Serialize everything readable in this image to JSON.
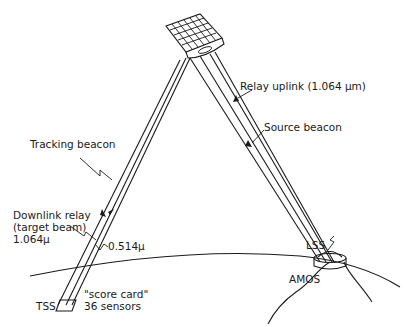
{
  "diagram": {
    "labels": {
      "relay_uplink": "Relay uplink (1.064 μm)",
      "source_beacon": "Source beacon",
      "tracking_beacon": "Tracking beacon",
      "downlink_line1": "Downlink relay",
      "downlink_line2": "(target beam)",
      "downlink_line3": "1.064μ",
      "green_wavelength": "0.514μ",
      "lss": "LSS",
      "amos": "AMOS",
      "tss": "TSS",
      "score_card_line1": "\"score card\"",
      "score_card_line2": "36 sensors"
    },
    "elements": {
      "satellite": "relay-mirror-satellite",
      "ground_station": "AMOS",
      "target": "TSS"
    }
  }
}
